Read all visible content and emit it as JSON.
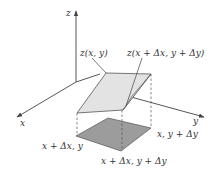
{
  "figure": {
    "colors": {
      "axis": "#444444",
      "surface_fill": "#e3e3e3",
      "surface_side_fill": "#d6d6d6",
      "base_fill": "#9c9c9c",
      "edge": "#555555",
      "dashed": "#555555",
      "text": "#333333"
    },
    "axes": {
      "z_label": "z",
      "x_label": "x",
      "y_label": "y"
    },
    "surface_labels": {
      "corner_xy": "z(x, y)",
      "corner_dx_dy": "z(x + Δx, y + Δy)"
    },
    "base_labels": {
      "corner_dx": "x + Δx, y",
      "corner_dy": "x, y + Δy",
      "corner_dx_dy": "x + Δx, y + Δy"
    }
  }
}
